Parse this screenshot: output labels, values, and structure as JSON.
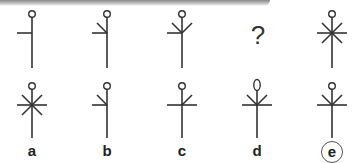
{
  "puzzle": {
    "type": "figure-series",
    "question_mark": "?",
    "colors": {
      "stroke": "#333333",
      "background": "#ffffff",
      "answer_ring": "#555555"
    },
    "sequence": [
      {
        "position": 1,
        "head": "circle",
        "arms": [
          "left"
        ]
      },
      {
        "position": 2,
        "head": "circle",
        "arms": [
          "left",
          "up-left"
        ]
      },
      {
        "position": 3,
        "head": "circle",
        "arms": [
          "left",
          "up-left",
          "up-right"
        ]
      },
      {
        "position": 4,
        "missing": true
      },
      {
        "position": 5,
        "head": "circle",
        "arms": [
          "left",
          "right",
          "up-left",
          "up-right",
          "down-left",
          "down-right"
        ]
      }
    ],
    "options": [
      {
        "label": "a",
        "head": "circle",
        "arms": [
          "left",
          "right",
          "up-left",
          "up-right",
          "down-left",
          "down-right"
        ]
      },
      {
        "label": "b",
        "head": "circle",
        "arms": [
          "left",
          "up-left"
        ]
      },
      {
        "label": "c",
        "head": "circle",
        "arms": [
          "left",
          "right",
          "up-right"
        ]
      },
      {
        "label": "d",
        "head": "oval",
        "arms": [
          "left",
          "right",
          "up-left",
          "up-right"
        ]
      },
      {
        "label": "e",
        "head": "circle",
        "arms": [
          "left",
          "right",
          "up-left",
          "up-right"
        ],
        "selected": true
      }
    ],
    "answer": "e"
  }
}
